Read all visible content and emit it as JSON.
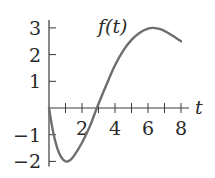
{
  "chart_data": {
    "type": "line",
    "title": "",
    "series_label": "f(t)",
    "xlabel": "t",
    "ylabel": "",
    "xlim": [
      0,
      8
    ],
    "ylim": [
      -2,
      3
    ],
    "x_ticks": [
      1,
      2,
      3,
      4,
      5,
      6,
      7,
      8
    ],
    "x_tick_labels": [
      {
        "value": 2,
        "label": "2"
      },
      {
        "value": 4,
        "label": "4"
      },
      {
        "value": 6,
        "label": "6"
      },
      {
        "value": 8,
        "label": "8"
      }
    ],
    "y_ticks": [
      {
        "value": 3,
        "label": "3"
      },
      {
        "value": 2,
        "label": "2"
      },
      {
        "value": 1,
        "label": "1"
      },
      {
        "value": -1,
        "label": "−1"
      },
      {
        "value": -2,
        "label": "−2"
      }
    ],
    "grid": false,
    "series": [
      {
        "name": "f(t)",
        "points": [
          [
            0,
            0
          ],
          [
            0.25,
            -0.9
          ],
          [
            0.5,
            -1.5
          ],
          [
            0.75,
            -1.85
          ],
          [
            1.0,
            -2.0
          ],
          [
            1.25,
            -1.97
          ],
          [
            1.5,
            -1.8
          ],
          [
            2.0,
            -1.3
          ],
          [
            2.5,
            -0.65
          ],
          [
            2.9,
            0.0
          ],
          [
            3.5,
            0.9
          ],
          [
            4.0,
            1.6
          ],
          [
            4.5,
            2.15
          ],
          [
            5.0,
            2.55
          ],
          [
            5.5,
            2.82
          ],
          [
            6.0,
            2.97
          ],
          [
            6.3,
            3.0
          ],
          [
            6.75,
            2.95
          ],
          [
            7.25,
            2.8
          ],
          [
            7.75,
            2.6
          ],
          [
            8.0,
            2.5
          ]
        ]
      }
    ]
  }
}
